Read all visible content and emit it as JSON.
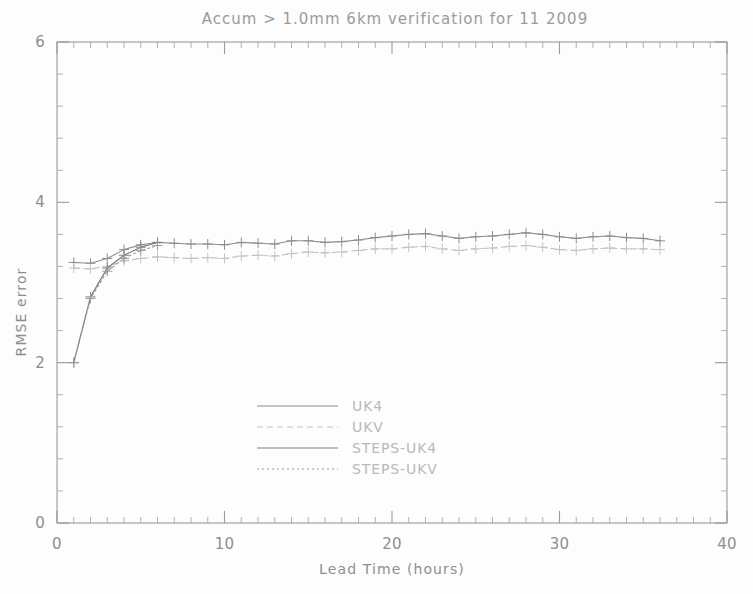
{
  "figure": {
    "title": "Accum > 1.0mm 6km verification for 11 2009",
    "background_color": "#fdfdfd",
    "frame_color": "#9a9a9a"
  },
  "chart_data": {
    "type": "line",
    "title": "Accum > 1.0mm 6km verification for 11 2009",
    "xlabel": "Lead Time (hours)",
    "ylabel": "RMSE error",
    "xlim": [
      0,
      40
    ],
    "ylim": [
      0,
      6
    ],
    "xticks": [
      0,
      10,
      20,
      30,
      40
    ],
    "yticks": [
      0,
      2,
      4,
      6
    ],
    "xtick_labels": [
      "0",
      "10",
      "20",
      "30",
      "40"
    ],
    "ytick_labels": [
      "0",
      "2",
      "4",
      "6"
    ],
    "x_minor_interval": 1,
    "y_minor_interval": 0.4,
    "grid": false,
    "legend_position": "center-left",
    "marker": "plus",
    "series": [
      {
        "name": "UK4",
        "color": "#8d8d8d",
        "dash": "none",
        "marker": "plus",
        "x": [
          1,
          2,
          3,
          4,
          5,
          6,
          7,
          8,
          9,
          10,
          11,
          12,
          13,
          14,
          15,
          16,
          17,
          18,
          19,
          20,
          21,
          22,
          23,
          24,
          25,
          26,
          27,
          28,
          29,
          30,
          31,
          32,
          33,
          34,
          35,
          36
        ],
        "y": [
          3.25,
          3.24,
          3.3,
          3.41,
          3.47,
          3.5,
          3.49,
          3.48,
          3.48,
          3.47,
          3.5,
          3.49,
          3.48,
          3.52,
          3.52,
          3.5,
          3.51,
          3.53,
          3.56,
          3.58,
          3.6,
          3.61,
          3.58,
          3.55,
          3.57,
          3.58,
          3.6,
          3.62,
          3.6,
          3.57,
          3.55,
          3.57,
          3.58,
          3.56,
          3.55,
          3.52
        ]
      },
      {
        "name": "UKV",
        "color": "#c3c3c3",
        "dash": "6,4",
        "marker": "plus",
        "x": [
          1,
          2,
          3,
          4,
          5,
          6,
          7,
          8,
          9,
          10,
          11,
          12,
          13,
          14,
          15,
          16,
          17,
          18,
          19,
          20,
          21,
          22,
          23,
          24,
          25,
          26,
          27,
          28,
          29,
          30,
          31,
          32,
          33,
          34,
          35,
          36
        ],
        "y": [
          3.18,
          3.17,
          3.2,
          3.27,
          3.3,
          3.32,
          3.31,
          3.3,
          3.31,
          3.3,
          3.33,
          3.34,
          3.33,
          3.36,
          3.38,
          3.37,
          3.38,
          3.4,
          3.42,
          3.42,
          3.44,
          3.45,
          3.42,
          3.4,
          3.42,
          3.43,
          3.45,
          3.46,
          3.44,
          3.41,
          3.4,
          3.42,
          3.43,
          3.42,
          3.42,
          3.41
        ]
      },
      {
        "name": "STEPS-UK4",
        "color": "#7e7e7e",
        "dash": "none",
        "marker": "plus",
        "x": [
          1,
          2,
          3,
          4,
          5,
          6
        ],
        "y": [
          2.0,
          2.82,
          3.18,
          3.34,
          3.44,
          3.5
        ]
      },
      {
        "name": "STEPS-UKV",
        "color": "#9c9c9c",
        "dash": "2,3",
        "marker": "plus",
        "x": [
          1,
          2,
          3,
          4,
          5,
          6
        ],
        "y": [
          2.0,
          2.8,
          3.14,
          3.3,
          3.4,
          3.46
        ]
      }
    ]
  },
  "legend": {
    "entries": [
      {
        "label": "UK4"
      },
      {
        "label": "UKV"
      },
      {
        "label": "STEPS-UK4"
      },
      {
        "label": "STEPS-UKV"
      }
    ]
  }
}
